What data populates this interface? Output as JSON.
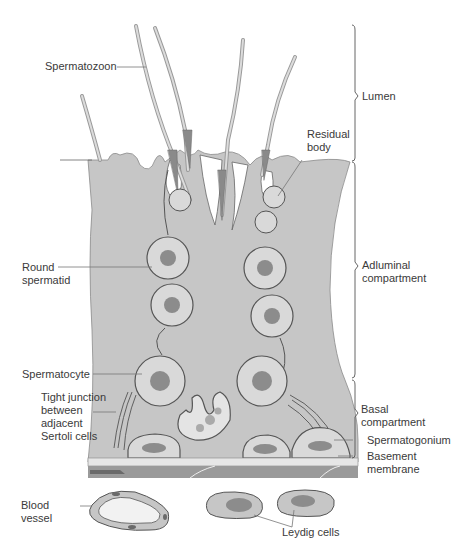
{
  "colors": {
    "epithelium": "#c6c6c6",
    "cell_fill": "#d9d9d9",
    "nucleus": "#8c8c8c",
    "outline": "#555555",
    "basement_light": "#e6e6e6",
    "basement_dark": "#9a9a9a",
    "lumen": "#ffffff",
    "text": "#3a3a3a"
  },
  "labels": {
    "spermatozoon": "Spermatozoon",
    "residual_body": "Residual\nbody",
    "round_spermatid": "Round\nspermatid",
    "spermatocyte": "Spermatocyte",
    "tight_junction": "Tight junction\nbetween\nadjacent\nSertoli cells",
    "blood_vessel": "Blood\nvessel",
    "leydig_cells": "Leydig cells",
    "spermatogonium": "Spermatogonium",
    "basement_membrane": "Basement\nmembrane"
  },
  "brackets": {
    "lumen": "Lumen",
    "adluminal": "Adluminal\ncompartment",
    "basal": "Basal\ncompartment"
  }
}
